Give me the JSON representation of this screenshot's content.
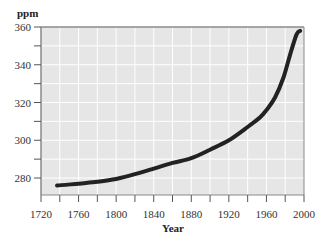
{
  "chart_data": {
    "type": "line",
    "title": "",
    "xlabel": "Year",
    "ylabel": "ppm",
    "xlim": [
      1720,
      2000
    ],
    "ylim": [
      271,
      360
    ],
    "xticks": [
      1720,
      1760,
      1800,
      1840,
      1880,
      1920,
      1960,
      2000
    ],
    "yticks": [
      280,
      300,
      320,
      340,
      360
    ],
    "grid": true,
    "legend": null,
    "series": [
      {
        "name": "Atmospheric CO2",
        "color": "#222222",
        "x": [
          1737,
          1760,
          1780,
          1800,
          1820,
          1840,
          1860,
          1880,
          1900,
          1920,
          1940,
          1953,
          1960,
          1969,
          1978,
          1985,
          1992,
          1996
        ],
        "y": [
          276,
          277,
          278,
          279.5,
          282,
          285,
          288,
          290.5,
          295,
          300,
          307,
          312,
          316,
          322.5,
          333,
          345,
          356,
          358
        ]
      }
    ]
  },
  "labels": {
    "ylabel": "ppm",
    "xlabel": "Year",
    "xticks": [
      "1720",
      "1760",
      "1800",
      "1840",
      "1880",
      "1920",
      "1960",
      "2000"
    ],
    "yticks": [
      "280",
      "300",
      "320",
      "340",
      "360"
    ]
  },
  "colors": {
    "plot_background": "#e6e6e6",
    "grid": "#ffffff",
    "border": "#8a8a8a",
    "line": "#222222"
  }
}
